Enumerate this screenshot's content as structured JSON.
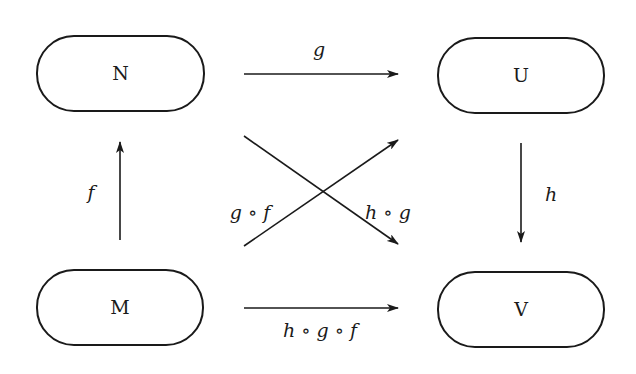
{
  "diagram": {
    "type": "commutative-diagram",
    "colors": {
      "ink": "#1a1a1a",
      "background": "#ffffff"
    },
    "nodes": [
      {
        "id": "N",
        "label": "N"
      },
      {
        "id": "U",
        "label": "U"
      },
      {
        "id": "M",
        "label": "M"
      },
      {
        "id": "V",
        "label": "V"
      }
    ],
    "edges": [
      {
        "id": "g",
        "from": "N",
        "to": "U",
        "label": "g"
      },
      {
        "id": "f",
        "from": "M",
        "to": "N",
        "label": "f"
      },
      {
        "id": "h",
        "from": "U",
        "to": "V",
        "label": "h"
      },
      {
        "id": "gof",
        "from": "M",
        "to": "U",
        "label": "g ∘ f"
      },
      {
        "id": "hog",
        "from": "N",
        "to": "V",
        "label": "h ∘ g"
      },
      {
        "id": "hogof",
        "from": "M",
        "to": "V",
        "label": "h ∘ g ∘ f"
      }
    ]
  }
}
